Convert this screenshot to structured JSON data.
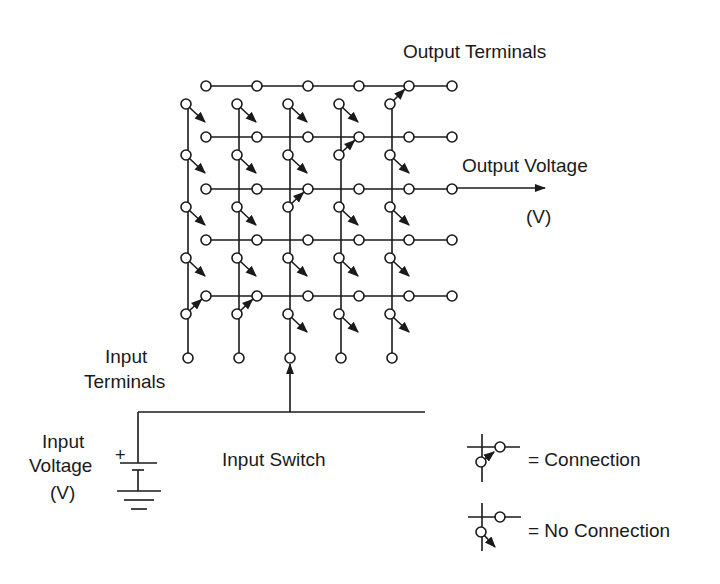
{
  "labels": {
    "output_terminals": "Output Terminals",
    "output_voltage": "Output Voltage",
    "output_voltage_unit": "(V)",
    "input_terminals_line1": "Input",
    "input_terminals_line2": "Terminals",
    "input_voltage_line1": "Input",
    "input_voltage_line2": "Voltage",
    "input_voltage_unit": "(V)",
    "battery_polarity": "+",
    "input_switch": "Input Switch"
  },
  "legend": [
    {
      "symbol": "connected-switch",
      "label": "= Connection"
    },
    {
      "symbol": "open-switch",
      "label": "= No Connection"
    }
  ],
  "matrix": {
    "columns": 5,
    "rows": 5,
    "output_terminals_per_row": 6,
    "connections": [
      [
        false,
        false,
        false,
        false,
        true
      ],
      [
        false,
        false,
        false,
        true,
        false
      ],
      [
        false,
        false,
        true,
        false,
        false
      ],
      [
        false,
        false,
        false,
        false,
        false
      ],
      [
        true,
        true,
        false,
        false,
        false
      ]
    ],
    "selected_input_column": 3,
    "output_voltage_row": 3
  },
  "colors": {
    "ink": "#1a1a1a",
    "background": "#ffffff"
  }
}
